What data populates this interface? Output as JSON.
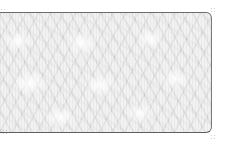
{
  "swatch": {
    "description": "texture-swatch",
    "pattern": "light frosted crinkled texture",
    "colors": {
      "base": "#f2f2f2",
      "highlight": "#ffffff",
      "shadow": "#c8c8c8",
      "border": "#6b6b6b"
    }
  }
}
